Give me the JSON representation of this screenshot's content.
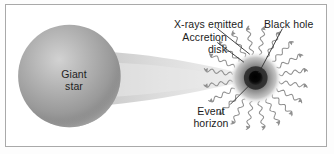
{
  "diagram": {
    "type": "astronomy-schematic",
    "background_color": "#ffffff",
    "border_color": "#a9a9a9",
    "labels": {
      "giant_star": "Giant\nstar",
      "accretion_disk": "Accretion\ndisk",
      "xrays_emitted": "X-rays emitted",
      "black_hole": "Black hole",
      "event_horizon": "Event\nhorizon"
    },
    "elements": {
      "giant_star": {
        "name": "giant-star-sphere",
        "shape": "sphere",
        "cx": 68,
        "cy": 76,
        "r": 54,
        "fill_light": "#c8c8c8",
        "fill_mid": "#9a9a9a",
        "fill_dark": "#777777"
      },
      "accretion_stream": {
        "name": "accretion-stream",
        "shape": "tapering-cone",
        "from_x": 110,
        "from_y": 76,
        "to_x": 250,
        "to_y": 78,
        "color": "#d8d8d8"
      },
      "black_hole": {
        "name": "black-hole-core",
        "cx": 264,
        "cy": 78,
        "core_r": 7,
        "ring_r": 11,
        "halo_r": 26,
        "core_color": "#0d0d0d",
        "ring_color": "#3a3a3a",
        "halo_color": "#8e8e8e"
      },
      "xray_rays": {
        "name": "xray-wavy-rays",
        "count": 20,
        "color": "#8a8a8a",
        "inner_radius": 26,
        "outer_radius": 56,
        "style": "sinusoidal-with-arrowhead"
      },
      "leader_lines": {
        "name": "leader-lines",
        "color": "#333333",
        "lines": [
          {
            "label": "xrays_emitted",
            "x1": 224,
            "y1": 26,
            "x2": 258,
            "y2": 52
          },
          {
            "label": "black_hole",
            "x1": 288,
            "y1": 27,
            "x2": 266,
            "y2": 72
          },
          {
            "label": "accretion_disk",
            "x1": 224,
            "y1": 40,
            "x2": 250,
            "y2": 62
          },
          {
            "label": "event_horizon",
            "x1": 238,
            "y1": 104,
            "x2": 258,
            "y2": 84
          }
        ]
      }
    }
  }
}
